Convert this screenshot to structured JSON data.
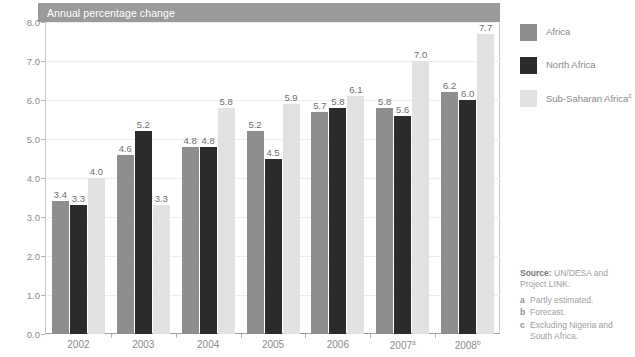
{
  "panel": {
    "title": "Annual percentage change"
  },
  "legend": {
    "items": [
      {
        "label": "Africa",
        "marker": "",
        "color": "#8e8e8e",
        "key": "africa"
      },
      {
        "label": "North Africa",
        "marker": "",
        "color": "#2b2b2b",
        "key": "north-africa"
      },
      {
        "label": "Sub-Saharan Africa",
        "marker": "c",
        "color": "#e2e2e2",
        "key": "subsaharan"
      }
    ]
  },
  "source": {
    "strong": "Source:",
    "text": " UN/DESA and Project LINK.",
    "footnotes": [
      {
        "marker": "a",
        "text": "Partly estimated."
      },
      {
        "marker": "b",
        "text": "Forecast."
      },
      {
        "marker": "c",
        "text": "Excluding Nigeria and South Africa."
      }
    ]
  },
  "chart_data": {
    "type": "bar",
    "title": "Annual percentage change",
    "xlabel": "",
    "ylabel": "",
    "ylim": [
      0.0,
      8.0
    ],
    "yticks": [
      "0.0",
      "1.0",
      "2.0",
      "3.0",
      "4.0",
      "5.0",
      "6.0",
      "7.0",
      "8.0"
    ],
    "grid": true,
    "legend_position": "right",
    "categories": [
      "2002",
      "2003",
      "2004",
      "2005",
      "2006",
      "2007",
      "2008"
    ],
    "category_markers": [
      "",
      "",
      "",
      "",
      "",
      "a",
      "b"
    ],
    "series": [
      {
        "name": "Africa",
        "color": "#8e8e8e",
        "values": [
          3.4,
          4.6,
          4.8,
          5.2,
          5.7,
          5.8,
          6.2
        ],
        "labels": [
          "3.4",
          "4.6",
          "4.8",
          "5.2",
          "5.7",
          "5.8",
          "6.2"
        ]
      },
      {
        "name": "North Africa",
        "color": "#2b2b2b",
        "values": [
          3.3,
          5.2,
          4.8,
          4.5,
          5.8,
          5.6,
          6.0
        ],
        "labels": [
          "3.3",
          "5.2",
          "4.8",
          "4.5",
          "5.8",
          "5.6",
          "6.0"
        ]
      },
      {
        "name": "Sub-Saharan Africa",
        "color": "#e2e2e2",
        "values": [
          4.0,
          3.3,
          5.8,
          5.9,
          6.1,
          7.0,
          7.7
        ],
        "labels": [
          "4.0",
          "3.3",
          "5.8",
          "5.9",
          "6.1",
          "7.0",
          "7.7"
        ]
      }
    ]
  }
}
